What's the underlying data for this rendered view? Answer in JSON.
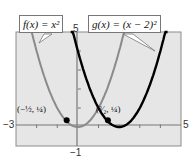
{
  "chart_data": {
    "type": "line",
    "title": "",
    "xlabel": "",
    "ylabel": "",
    "xlim": [
      -3,
      5
    ],
    "ylim": [
      -1,
      5
    ],
    "grid": false,
    "background": "#e6e6e6",
    "tick_labels": {
      "x_min": "−3",
      "x_max": "5",
      "y_min": "−1",
      "y_max": "5"
    },
    "series": [
      {
        "name": "f(x) = x^2",
        "label": "f(x) = x²",
        "color": "#8a8a8a",
        "x": [
          -2.2,
          -2,
          -1.5,
          -1,
          -0.5,
          0,
          0.5,
          1,
          1.5,
          2,
          2.2
        ],
        "values": [
          4.84,
          4,
          2.25,
          1,
          0.25,
          0,
          0.25,
          1,
          2.25,
          4,
          4.84
        ]
      },
      {
        "name": "g(x) = (x - 2)^2",
        "label": "g(x) = (x − 2)²",
        "color": "#000000",
        "x": [
          -0.2,
          0,
          0.5,
          1,
          1.5,
          2,
          2.5,
          3,
          3.5,
          4,
          4.2
        ],
        "values": [
          4.84,
          4,
          2.25,
          1,
          0.25,
          0,
          0.25,
          1,
          2.25,
          4,
          4.84
        ]
      }
    ],
    "annotations": [
      {
        "text": "(−1/2, 1/4)",
        "x": -0.5,
        "y": 0.25,
        "marker": "point"
      },
      {
        "text": "(3/2, 1/4)",
        "x": 1.5,
        "y": 0.25,
        "marker": "point"
      }
    ]
  },
  "labels": {
    "f_callout": "f(x) = x²",
    "g_callout": "g(x) = (x − 2)²",
    "x_min": "−3",
    "x_max": "5",
    "y_max": "5",
    "y_min": "−1",
    "point_left": "(−½, ¼)",
    "point_right": "(³⁄₂, ¼)"
  }
}
